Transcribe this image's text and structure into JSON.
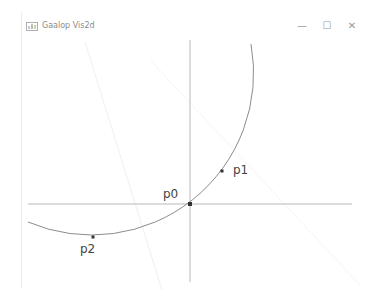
{
  "window": {
    "title": "Gaalop Vis2d",
    "controls": {
      "minimize": "—",
      "maximize": "☐",
      "close": "✕"
    }
  },
  "plot": {
    "points": [
      {
        "name": "p0",
        "x": 190,
        "y": 204,
        "label_x": 163,
        "label_y": 187
      },
      {
        "name": "p1",
        "x": 222,
        "y": 171,
        "label_x": 233,
        "label_y": 163
      },
      {
        "name": "p2",
        "x": 93,
        "y": 237,
        "label_x": 80,
        "label_y": 242
      }
    ],
    "circle": {
      "cx": 92,
      "cy": 75,
      "r": 162
    },
    "axis_color": "#b8b8b8",
    "curve_color": "#8c8c8c",
    "point_color": "#333333"
  }
}
